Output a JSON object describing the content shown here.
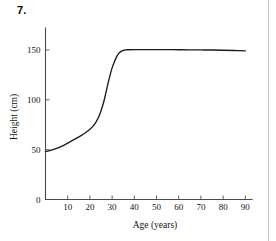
{
  "figure": {
    "number_label": "7."
  },
  "page": {
    "column_rule": "vertical-rule",
    "background_color": "#ffffff"
  },
  "chart_data": {
    "type": "line",
    "title": "",
    "xlabel": "Age (years)",
    "ylabel": "Height (cm)",
    "xlim": [
      0,
      93
    ],
    "ylim": [
      0,
      172
    ],
    "xticks": [
      10,
      20,
      30,
      40,
      50,
      60,
      70,
      80,
      90
    ],
    "xtick_labels": [
      "10",
      "20",
      "30",
      "40",
      "50",
      "60",
      "70",
      "80",
      "90"
    ],
    "yticks": [
      0,
      50,
      100,
      150
    ],
    "ytick_labels": [
      "0",
      "50",
      "100",
      "150"
    ],
    "grid": false,
    "legend": false,
    "legend_position": "none",
    "line_color": "#1b1b1b",
    "axis_color": "#4a4a4a",
    "series": [
      {
        "name": "Height vs age",
        "x": [
          0,
          2,
          4,
          6,
          8,
          10,
          12,
          14,
          16,
          18,
          20,
          22,
          24,
          25,
          26,
          27,
          28,
          29,
          30,
          31,
          32,
          33,
          34,
          35,
          36,
          37,
          40,
          45,
          50,
          55,
          60,
          65,
          70,
          75,
          80,
          85,
          90
        ],
        "y": [
          48,
          49,
          50.5,
          52,
          54,
          56.5,
          59,
          61.5,
          64,
          67,
          70.5,
          75,
          83,
          89,
          96,
          105,
          115,
          124,
          132,
          138,
          143,
          146.5,
          148.5,
          149.5,
          150,
          150.2,
          150.3,
          150.3,
          150.3,
          150.3,
          150.2,
          150.1,
          150,
          149.9,
          149.7,
          149.4,
          149
        ]
      }
    ]
  }
}
